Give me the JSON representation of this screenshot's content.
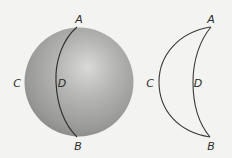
{
  "figure": {
    "colors": {
      "background": "#f3f3f1",
      "sphere_highlight": "#d6d6d4",
      "sphere_mid": "#a8a8a6",
      "sphere_rim": "#8a8a88",
      "stroke": "#3a3a3a"
    },
    "sphere": {
      "labels": {
        "A": "A",
        "B": "B",
        "C": "C",
        "D": "D"
      }
    },
    "lune": {
      "labels": {
        "A": "A",
        "B": "B",
        "C": "C",
        "D": "D"
      }
    }
  }
}
